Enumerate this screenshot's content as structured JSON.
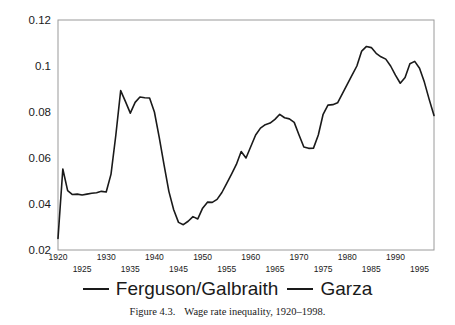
{
  "figure": {
    "caption_number": "Figure 4.3.",
    "caption_text": "Wage rate inequality, 1920–1998."
  },
  "legend": {
    "position": "below-plot",
    "entries": [
      {
        "label": "Ferguson/Galbraith",
        "marker": "line-dash-icon",
        "color": "#1a1a1a"
      },
      {
        "label": "Garza",
        "marker": "line-dash-icon",
        "color": "#1a1a1a"
      }
    ]
  },
  "axes": {
    "y_ticks": [
      "0.02",
      "0.04",
      "0.06",
      "0.08",
      "0.1",
      "0.12"
    ],
    "x_ticks_upper": [
      "1920",
      "1930",
      "1940",
      "1950",
      "1960",
      "1970",
      "1980",
      "1990"
    ],
    "x_ticks_lower": [
      "1925",
      "1935",
      "1945",
      "1955",
      "1965",
      "1975",
      "1985",
      "1995"
    ]
  },
  "chart_data": {
    "type": "line",
    "title": "Wage rate inequality, 1920–1998",
    "xlabel": "",
    "ylabel": "",
    "xlim": [
      1920,
      1998
    ],
    "ylim": [
      0.02,
      0.12
    ],
    "grid": false,
    "legend_position": "below",
    "series": [
      {
        "name": "Ferguson/Galbraith — Garza",
        "color": "#1a1a1a",
        "x": [
          1920,
          1921,
          1922,
          1923,
          1924,
          1925,
          1926,
          1927,
          1928,
          1929,
          1930,
          1931,
          1932,
          1933,
          1934,
          1935,
          1936,
          1937,
          1938,
          1939,
          1940,
          1941,
          1942,
          1943,
          1944,
          1945,
          1946,
          1947,
          1948,
          1949,
          1950,
          1951,
          1952,
          1953,
          1954,
          1955,
          1956,
          1957,
          1958,
          1959,
          1960,
          1961,
          1962,
          1963,
          1964,
          1965,
          1966,
          1967,
          1968,
          1969,
          1970,
          1971,
          1972,
          1973,
          1974,
          1975,
          1976,
          1977,
          1978,
          1979,
          1980,
          1981,
          1982,
          1983,
          1984,
          1985,
          1986,
          1987,
          1988,
          1989,
          1990,
          1991,
          1992,
          1993,
          1994,
          1995,
          1996,
          1997,
          1998
        ],
        "values": [
          0.025,
          0.0552,
          0.0458,
          0.0441,
          0.0443,
          0.0439,
          0.0443,
          0.0447,
          0.0449,
          0.0455,
          0.0452,
          0.053,
          0.07,
          0.0893,
          0.0845,
          0.0795,
          0.0842,
          0.0865,
          0.0862,
          0.0861,
          0.08,
          0.069,
          0.057,
          0.0455,
          0.0375,
          0.032,
          0.031,
          0.0325,
          0.0345,
          0.0335,
          0.0382,
          0.0408,
          0.0407,
          0.042,
          0.045,
          0.049,
          0.053,
          0.0572,
          0.0628,
          0.06,
          0.065,
          0.07,
          0.073,
          0.0745,
          0.0752,
          0.0768,
          0.079,
          0.0775,
          0.077,
          0.0755,
          0.07,
          0.0648,
          0.0642,
          0.0643,
          0.07,
          0.079,
          0.083,
          0.0832,
          0.084,
          0.088,
          0.092,
          0.096,
          0.1,
          0.1065,
          0.1085,
          0.108,
          0.1055,
          0.104,
          0.103,
          0.1,
          0.096,
          0.0925,
          0.095,
          0.101,
          0.102,
          0.099,
          0.093,
          0.0855,
          0.0785
        ]
      }
    ]
  }
}
